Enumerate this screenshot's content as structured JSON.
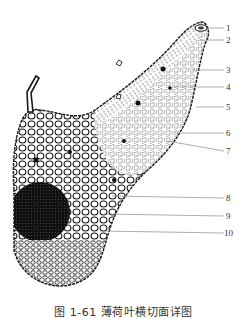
{
  "figure": {
    "caption": "图 1-61   薄荷叶横切面详图",
    "colors": {
      "ink": "#1a1a1a",
      "leader": "#8a8a8a",
      "background": "#ffffff"
    }
  },
  "labels": [
    {
      "id": "1",
      "text": "1",
      "y": 28
    },
    {
      "id": "2",
      "text": "2",
      "y": 40
    },
    {
      "id": "3",
      "text": "3",
      "y": 70
    },
    {
      "id": "4",
      "text": "4",
      "y": 87
    },
    {
      "id": "5",
      "text": "5",
      "y": 107
    },
    {
      "id": "6",
      "text": "6",
      "y": 133
    },
    {
      "id": "7",
      "text": "7",
      "y": 151
    },
    {
      "id": "8",
      "text": "8",
      "y": 198
    },
    {
      "id": "9",
      "text": "9",
      "y": 216
    },
    {
      "id": "10",
      "text": "10",
      "y": 233
    }
  ]
}
